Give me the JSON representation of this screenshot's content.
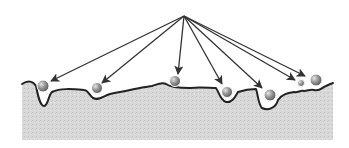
{
  "diagram": {
    "colors": {
      "background": "#ffffff",
      "ground_fill": "#d6d6d6",
      "surface_line": "#222222",
      "arrow": "#333333",
      "particle_light": "#cfcfcf",
      "particle_dark": "#6a6a6a"
    },
    "source_point": {
      "x": 184,
      "y": 16
    },
    "particles": [
      {
        "id": 1,
        "cx": 43,
        "cy": 86,
        "r": 6,
        "arrow_tip": {
          "x": 51,
          "y": 81
        }
      },
      {
        "id": 2,
        "cx": 97,
        "cy": 88,
        "r": 5.5,
        "arrow_tip": {
          "x": 102,
          "y": 83
        }
      },
      {
        "id": 3,
        "cx": 175,
        "cy": 81,
        "r": 5.5,
        "arrow_tip": {
          "x": 178,
          "y": 74
        }
      },
      {
        "id": 4,
        "cx": 227,
        "cy": 92,
        "r": 5.5,
        "arrow_tip": {
          "x": 222,
          "y": 84
        }
      },
      {
        "id": 5,
        "cx": 270,
        "cy": 95,
        "r": 6,
        "arrow_tip": {
          "x": 262,
          "y": 88
        }
      },
      {
        "id": 6,
        "cx": 301,
        "cy": 83,
        "r": 3.5,
        "arrow_tip": {
          "x": 295,
          "y": 80
        }
      },
      {
        "id": 7,
        "cx": 316,
        "cy": 80,
        "r": 6,
        "arrow_tip": {
          "x": 305,
          "y": 76
        }
      }
    ]
  }
}
